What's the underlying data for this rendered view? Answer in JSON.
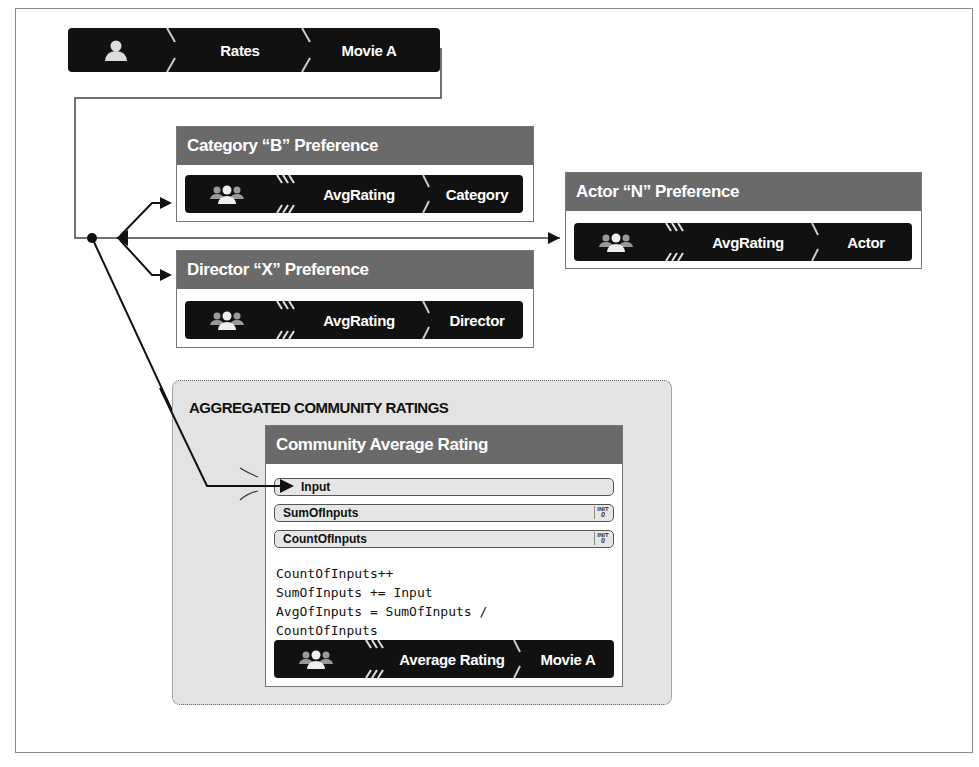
{
  "source_bar": {
    "icon": "person-icon",
    "relation": "Rates",
    "target": "Movie A"
  },
  "preferences": [
    {
      "title": "Category “B” Preference",
      "metric": "AvgRating",
      "key": "Category",
      "icon": "group-icon"
    },
    {
      "title": "Director “X” Preference",
      "metric": "AvgRating",
      "key": "Director",
      "icon": "group-icon"
    },
    {
      "title": "Actor “N” Preference",
      "metric": "AvgRating",
      "key": "Actor",
      "icon": "group-icon"
    }
  ],
  "community": {
    "group_title": "AGGREGATED COMMUNITY RATINGS",
    "card_title": "Community Average Rating",
    "fields": [
      {
        "label": "Input",
        "init": false
      },
      {
        "label": "SumOfInputs",
        "init": true,
        "init_label": "INIT",
        "init_value": "0"
      },
      {
        "label": "CountOfInputs",
        "init": true,
        "init_label": "INIT",
        "init_value": "0"
      }
    ],
    "code_lines": [
      "CountOfInputs++",
      "SumOfInputs += Input",
      "AvgOfInputs = SumOfInputs /",
      "CountOfInputs"
    ],
    "output": {
      "metric": "Average Rating",
      "key": "Movie A",
      "icon": "group-icon"
    }
  },
  "colors": {
    "bar": "#111111",
    "card_header": "#6a6a6a",
    "group_bg": "#e3e3e3",
    "frame": "#8a8a8a"
  }
}
